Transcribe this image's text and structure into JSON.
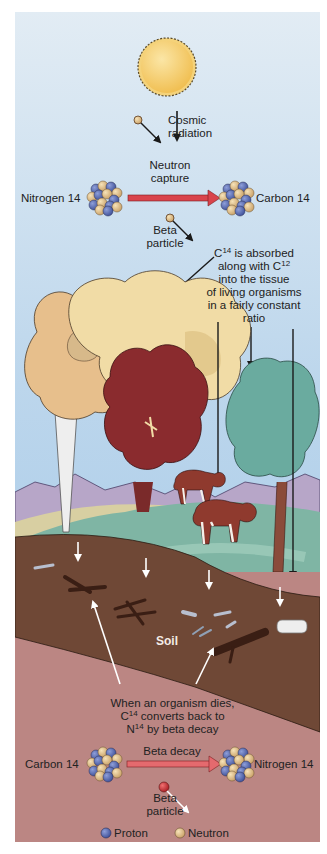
{
  "diagram": {
    "colors": {
      "sky_top": "#dfeaf3",
      "sky_bottom": "#a9cbe6",
      "sun": "#f3c862",
      "arrow_red": "#d9444c",
      "soil": "#6f4836",
      "subsoil": "#b97e7c",
      "proton": "#5b6fb5",
      "neutron": "#e4c38e",
      "beta_particle_top": "#e6b58a",
      "beta_particle_bottom": "#c0272d"
    },
    "top": {
      "cosmic_radiation": [
        "Cosmic",
        "radiation"
      ],
      "neutron_capture": [
        "Neutron",
        "capture"
      ],
      "nitrogen_14": "Nitrogen 14",
      "carbon_14": "Carbon 14",
      "beta_particle": [
        "Beta",
        "particle"
      ]
    },
    "absorption_note": {
      "line1_prefix": "C",
      "line1_sup": "14",
      "line1_suffix": " is absorbed",
      "line2_prefix": "along with C",
      "line2_sup": "12",
      "line3": "into the tissue",
      "line4": "of living organisms",
      "line5": "in a fairly constant",
      "line6": "ratio"
    },
    "soil_label": "Soil",
    "death_note": {
      "line1": "When an organism dies,",
      "line2_prefix": "C",
      "line2_sup": "14",
      "line2_suffix": " converts back to",
      "line3_prefix": "N",
      "line3_sup": "14",
      "line3_suffix": " by beta decay"
    },
    "bottom": {
      "beta_decay": "Beta decay",
      "carbon_14": "Carbon 14",
      "nitrogen_14": "Nitrogen 14",
      "beta_particle": [
        "Beta",
        "particle"
      ]
    },
    "legend": {
      "proton": "Proton",
      "neutron": "Neutron"
    }
  }
}
